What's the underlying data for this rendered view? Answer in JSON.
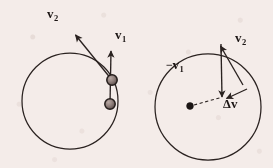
{
  "figure": {
    "background_color": "#f4ece9",
    "ink_color": "#2a2220",
    "width": 273,
    "height": 168
  },
  "left_panel": {
    "name": "circular-path-with-instantaneous-velocities",
    "circle": {
      "cx": 70,
      "cy": 101,
      "r": 48
    },
    "particles": [
      {
        "name": "particle-position-1",
        "cx": 112,
        "cy": 80,
        "r": 5.2
      },
      {
        "name": "particle-position-2",
        "cx": 110,
        "cy": 104,
        "r": 5.2
      }
    ],
    "vectors": [
      {
        "name": "velocity-v1-arrow",
        "label": "v",
        "subscript": "1",
        "from": {
          "x": 110,
          "y": 104
        },
        "to": {
          "x": 111,
          "y": 48
        },
        "label_pos": {
          "x": 117,
          "y": 31
        }
      },
      {
        "name": "velocity-v2-arrow",
        "label": "v",
        "subscript": "2",
        "from": {
          "x": 112,
          "y": 80
        },
        "to": {
          "x": 73,
          "y": 32
        },
        "label_pos": {
          "x": 50,
          "y": 10
        }
      }
    ]
  },
  "right_panel": {
    "name": "velocity-difference-triangle",
    "circle": {
      "cx": 208,
      "cy": 107,
      "r": 53
    },
    "center_dot": {
      "name": "circle-center-dot",
      "cx": 190,
      "cy": 106,
      "r": 3.4
    },
    "dashed_line": {
      "name": "radius-dashed-line",
      "from": {
        "x": 193,
        "y": 105
      },
      "to": {
        "x": 224,
        "y": 96
      }
    },
    "vectors": [
      {
        "name": "negative-velocity-v1-arrow",
        "label": "−v",
        "subscript": "1",
        "from": {
          "x": 221,
          "y": 44
        },
        "to": {
          "x": 222,
          "y": 100
        },
        "label_pos": {
          "x": 181,
          "y": 63
        }
      },
      {
        "name": "velocity-v2-arrow",
        "label": "v",
        "subscript": "2",
        "from": {
          "x": 242,
          "y": 84
        },
        "to": {
          "x": 219,
          "y": 43
        },
        "label_pos": {
          "x": 236,
          "y": 34
        }
      },
      {
        "name": "delta-v-arrow",
        "label": "Δv",
        "subscript": "",
        "from": {
          "x": 246,
          "y": 88
        },
        "to": {
          "x": 224,
          "y": 99
        },
        "label_pos": {
          "x": 222,
          "y": 98
        }
      }
    ]
  },
  "labels": {
    "left_v1": {
      "base": "v",
      "sub": "1"
    },
    "left_v2": {
      "base": "v",
      "sub": "2"
    },
    "right_neg_v1": {
      "minus": "−",
      "base": "v",
      "sub": "1"
    },
    "right_v2": {
      "base": "v",
      "sub": "2"
    },
    "right_delta_v": {
      "delta": "Δ",
      "base": "v"
    }
  }
}
